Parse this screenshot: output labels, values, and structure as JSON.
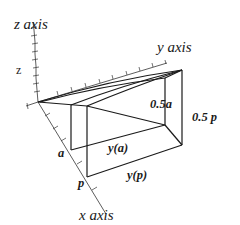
{
  "diagram": {
    "axes": {
      "z": {
        "label": "z axis",
        "variable": "z"
      },
      "y": {
        "label": "y axis"
      },
      "x": {
        "label": "x axis"
      }
    },
    "points": {
      "a": "a",
      "p": "p"
    },
    "edge_labels": {
      "y_a": "y(a)",
      "y_p": "y(p)",
      "half_a": "0.5a",
      "half_p": "0.5 p"
    },
    "colors": {
      "line": "#1a1a1a",
      "background": "#ffffff"
    }
  }
}
